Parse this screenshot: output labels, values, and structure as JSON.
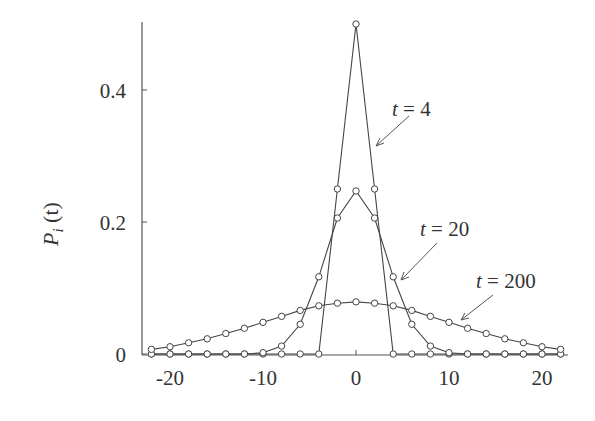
{
  "chart_data": {
    "type": "line",
    "title": "",
    "xlabel": "",
    "ylabel": "P_i (t)",
    "xlim": [
      -23,
      23
    ],
    "ylim": [
      0,
      0.5
    ],
    "grid": false,
    "legend": "none (inline arrow annotations)",
    "x_ticks": [
      -20,
      -10,
      0,
      10,
      20
    ],
    "x_tick_labels": [
      "-20",
      "-10",
      "0",
      "10",
      "20"
    ],
    "y_ticks": [
      0,
      0.2,
      0.4
    ],
    "y_tick_labels": [
      "0",
      "0.2",
      "0.4"
    ],
    "x": [
      -22,
      -20,
      -18,
      -16,
      -14,
      -12,
      -10,
      -8,
      -6,
      -4,
      -2,
      0,
      2,
      4,
      6,
      8,
      10,
      12,
      14,
      16,
      18,
      20,
      22
    ],
    "series": [
      {
        "name": "t = 4",
        "values": [
          0,
          0,
          0,
          0,
          0,
          0,
          0,
          0,
          0,
          0,
          0.25,
          0.5,
          0.25,
          0,
          0,
          0,
          0,
          0,
          0,
          0,
          0,
          0,
          0
        ]
      },
      {
        "name": "t = 20",
        "values": [
          0,
          0,
          0,
          0,
          0,
          0,
          0.002,
          0.012,
          0.045,
          0.117,
          0.206,
          0.247,
          0.206,
          0.117,
          0.045,
          0.012,
          0.002,
          0,
          0,
          0,
          0,
          0,
          0
        ]
      },
      {
        "name": "t = 200",
        "values": [
          0.007,
          0.011,
          0.017,
          0.023,
          0.031,
          0.039,
          0.048,
          0.057,
          0.066,
          0.073,
          0.077,
          0.079,
          0.077,
          0.073,
          0.066,
          0.057,
          0.048,
          0.039,
          0.031,
          0.023,
          0.017,
          0.011,
          0.007
        ]
      }
    ],
    "annotations": [
      {
        "text": "t = 4",
        "points_to": {
          "x": 2.8,
          "y": 0.34
        }
      },
      {
        "text": "t = 20",
        "points_to": {
          "x": 4.4,
          "y": 0.115
        }
      },
      {
        "text": "t = 200",
        "points_to": {
          "x": 11,
          "y": 0.045
        }
      }
    ],
    "marker": "open circle",
    "line_color": "#333333"
  },
  "labels": {
    "ylabel_main": "P",
    "ylabel_sub": "i",
    "ylabel_arg": " (t)",
    "annot": [
      {
        "var": "t",
        "rest": " = 4"
      },
      {
        "var": "t",
        "rest": " = 20"
      },
      {
        "var": "t",
        "rest": " = 200"
      }
    ]
  }
}
